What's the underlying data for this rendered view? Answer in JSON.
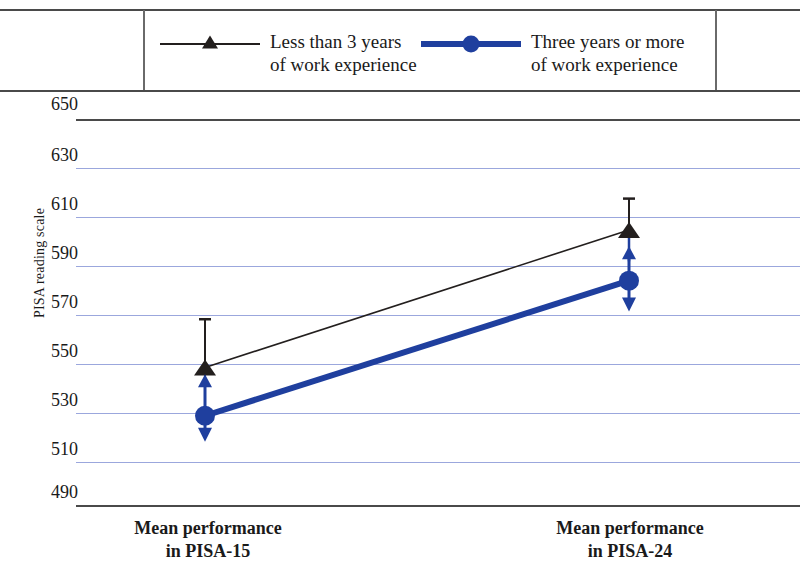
{
  "legend": {
    "entries": [
      {
        "label": "Less than 3 years\nof work experience",
        "marker": "triangle-marker",
        "color": "#231f1e"
      },
      {
        "label": "Three years or more\nof work experience",
        "marker": "circle-marker",
        "color": "#1f3f9e"
      }
    ]
  },
  "axis": {
    "y_title": "PISA reading scale",
    "y_ticks": [
      "650",
      "630",
      "610",
      "590",
      "570",
      "550",
      "530",
      "510",
      "490"
    ],
    "x_labels": [
      "Mean performance\nin PISA-15",
      "Mean performance\nin PISA-24"
    ]
  },
  "chart_data": {
    "type": "line",
    "title": "",
    "xlabel": "",
    "ylabel": "PISA reading scale",
    "ylim": [
      490,
      650
    ],
    "ytick_step": 20,
    "grid": true,
    "legend_position": "top",
    "categories": [
      "Mean performance in PISA-15",
      "Mean performance in PISA-24"
    ],
    "series": [
      {
        "name": "Less than 3 years of work experience",
        "color": "#231f1e",
        "marker": "triangle",
        "line_width": 1.6,
        "values": [
          547,
          604
        ],
        "error_low": [
          547,
          591
        ],
        "error_high": [
          567,
          617
        ]
      },
      {
        "name": "Three years or more of work experience",
        "color": "#1f3f9e",
        "marker": "circle",
        "line_width": 6,
        "values": [
          527,
          583
        ],
        "error_low": [
          517,
          571
        ],
        "error_high": [
          543,
          596
        ]
      }
    ]
  }
}
